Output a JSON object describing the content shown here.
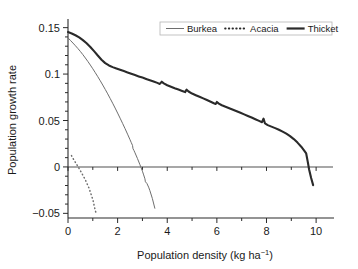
{
  "chart_data": {
    "type": "line",
    "title": "",
    "xlabel": "Population density  (kg ha",
    "xlabel_sup": "-1",
    "xlabel_tail": ")",
    "ylabel": "Population growth rate",
    "xlim": [
      0,
      10.6
    ],
    "ylim": [
      -0.055,
      0.155
    ],
    "xticks": [
      0,
      2,
      4,
      6,
      8,
      10
    ],
    "xticklabels": [
      "0",
      "2",
      "4",
      "6",
      "8",
      "10"
    ],
    "yticks": [
      -0.05,
      0,
      0.05,
      0.1,
      0.15
    ],
    "yticklabels": [
      "-0.05",
      "0",
      "0.05",
      "0.1",
      "0.15"
    ],
    "minor_xticks": [
      1,
      3,
      5,
      7,
      9
    ],
    "minor_yticks": [
      -0.04,
      -0.03,
      -0.02,
      -0.01,
      0.01,
      0.02,
      0.03,
      0.04,
      0.06,
      0.07,
      0.08,
      0.09,
      0.11,
      0.12,
      0.13,
      0.14
    ],
    "grid": false,
    "zero_reference_line": 0,
    "legend_position": "top-right",
    "series": [
      {
        "name": "Burkea",
        "style": "thin-solid",
        "color": "#6e6e6e",
        "points": [
          [
            0.0,
            0.139
          ],
          [
            0.1,
            0.1362
          ],
          [
            0.2,
            0.1334
          ],
          [
            0.3,
            0.1305
          ],
          [
            0.4,
            0.1275
          ],
          [
            0.5,
            0.1243
          ],
          [
            0.6,
            0.1209
          ],
          [
            0.7,
            0.1173
          ],
          [
            0.8,
            0.1136
          ],
          [
            0.9,
            0.1097
          ],
          [
            1.0,
            0.1057
          ],
          [
            1.1,
            0.1015
          ],
          [
            1.2,
            0.0972
          ],
          [
            1.3,
            0.0928
          ],
          [
            1.4,
            0.0882
          ],
          [
            1.5,
            0.0835
          ],
          [
            1.6,
            0.0787
          ],
          [
            1.7,
            0.0737
          ],
          [
            1.8,
            0.0686
          ],
          [
            1.9,
            0.0634
          ],
          [
            2.0,
            0.058
          ],
          [
            2.1,
            0.0525
          ],
          [
            2.2,
            0.0469
          ],
          [
            2.3,
            0.0412
          ],
          [
            2.4,
            0.0353
          ],
          [
            2.5,
            0.0293
          ],
          [
            2.55,
            0.0262
          ],
          [
            2.6,
            0.0232
          ],
          [
            2.62,
            0.0196
          ],
          [
            2.66,
            0.0176
          ],
          [
            2.7,
            0.0152
          ],
          [
            2.8,
            0.009
          ],
          [
            2.9,
            0.0024
          ],
          [
            2.95,
            -0.001
          ],
          [
            3.0,
            -0.0046
          ],
          [
            3.05,
            -0.0086
          ],
          [
            3.1,
            -0.0128
          ],
          [
            3.12,
            -0.016
          ],
          [
            3.18,
            -0.0178
          ],
          [
            3.25,
            -0.0218
          ],
          [
            3.3,
            -0.0255
          ],
          [
            3.4,
            -0.034
          ],
          [
            3.5,
            -0.0445
          ]
        ]
      },
      {
        "name": "Acacia",
        "style": "dotted",
        "color": "#6e6e6e",
        "points": [
          [
            0.14,
            0.0122
          ],
          [
            0.25,
            0.007
          ],
          [
            0.4,
            0.0005
          ],
          [
            0.55,
            -0.0065
          ],
          [
            0.7,
            -0.014
          ],
          [
            0.85,
            -0.023
          ],
          [
            1.0,
            -0.035
          ],
          [
            1.1,
            -0.047
          ],
          [
            1.14,
            -0.05
          ]
        ]
      },
      {
        "name": "Thicket",
        "style": "thick-solid",
        "color": "#2a2a2a",
        "points": [
          [
            0.0,
            0.1452
          ],
          [
            0.15,
            0.1437
          ],
          [
            0.3,
            0.1418
          ],
          [
            0.45,
            0.1395
          ],
          [
            0.6,
            0.1366
          ],
          [
            0.75,
            0.1332
          ],
          [
            0.9,
            0.1292
          ],
          [
            1.05,
            0.1247
          ],
          [
            1.2,
            0.12
          ],
          [
            1.35,
            0.1155
          ],
          [
            1.5,
            0.1118
          ],
          [
            1.65,
            0.1093
          ],
          [
            1.8,
            0.1075
          ],
          [
            1.95,
            0.106
          ],
          [
            2.1,
            0.1046
          ],
          [
            2.25,
            0.1032
          ],
          [
            2.4,
            0.1018
          ],
          [
            2.55,
            0.1003
          ],
          [
            2.7,
            0.0989
          ],
          [
            2.85,
            0.0975
          ],
          [
            3.0,
            0.0962
          ],
          [
            3.15,
            0.0948
          ],
          [
            3.3,
            0.0934
          ],
          [
            3.45,
            0.092
          ],
          [
            3.6,
            0.0905
          ],
          [
            3.7,
            0.0894
          ],
          [
            3.78,
            0.0918
          ],
          [
            3.86,
            0.09
          ],
          [
            4.0,
            0.088
          ],
          [
            4.15,
            0.0864
          ],
          [
            4.3,
            0.0848
          ],
          [
            4.45,
            0.0833
          ],
          [
            4.6,
            0.0818
          ],
          [
            4.72,
            0.0806
          ],
          [
            4.78,
            0.0832
          ],
          [
            4.86,
            0.0812
          ],
          [
            5.0,
            0.079
          ],
          [
            5.15,
            0.0772
          ],
          [
            5.3,
            0.0755
          ],
          [
            5.45,
            0.0738
          ],
          [
            5.6,
            0.072
          ],
          [
            5.75,
            0.0702
          ],
          [
            5.88,
            0.0686
          ],
          [
            5.95,
            0.0678
          ],
          [
            6.0,
            0.07
          ],
          [
            6.08,
            0.0682
          ],
          [
            6.2,
            0.0664
          ],
          [
            6.35,
            0.0648
          ],
          [
            6.5,
            0.0632
          ],
          [
            6.65,
            0.0616
          ],
          [
            6.8,
            0.06
          ],
          [
            6.95,
            0.0583
          ],
          [
            7.1,
            0.0566
          ],
          [
            7.25,
            0.0549
          ],
          [
            7.4,
            0.0532
          ],
          [
            7.55,
            0.0514
          ],
          [
            7.7,
            0.0496
          ],
          [
            7.82,
            0.0482
          ],
          [
            7.88,
            0.052
          ],
          [
            7.94,
            0.0468
          ],
          [
            8.05,
            0.045
          ],
          [
            8.2,
            0.0434
          ],
          [
            8.35,
            0.0418
          ],
          [
            8.5,
            0.04
          ],
          [
            8.65,
            0.038
          ],
          [
            8.8,
            0.0358
          ],
          [
            8.95,
            0.0332
          ],
          [
            9.1,
            0.03
          ],
          [
            9.25,
            0.0262
          ],
          [
            9.4,
            0.0218
          ],
          [
            9.52,
            0.0176
          ],
          [
            9.6,
            0.0145
          ],
          [
            9.66,
            0.006
          ],
          [
            9.72,
            -0.003
          ],
          [
            9.8,
            -0.012
          ],
          [
            9.88,
            -0.0196
          ]
        ]
      }
    ],
    "legend": [
      {
        "label": "Burkea",
        "style": "thin-solid"
      },
      {
        "label": "Acacia",
        "style": "dotted"
      },
      {
        "label": "Thicket",
        "style": "thick-solid"
      }
    ]
  }
}
